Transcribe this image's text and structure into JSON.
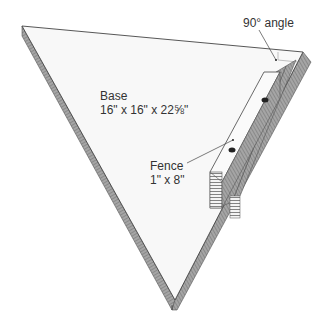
{
  "diagram": {
    "labels": {
      "base": {
        "name": "Base",
        "dims": "16\" x 16\" x 22⅝\""
      },
      "fence": {
        "name": "Fence",
        "dims": "1\" x 8\""
      },
      "angle": {
        "text": "90° angle"
      }
    },
    "colors": {
      "face": "#f7f7f7",
      "edge_line": "#555555",
      "side_shade": "#9a9a9a",
      "side_stripe": "#6e6e6e",
      "text": "#333333",
      "hole": "#222222"
    }
  }
}
